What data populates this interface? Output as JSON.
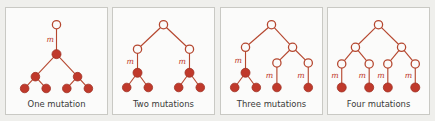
{
  "figure": {
    "background_color": "#efefec",
    "panel_background": "#fbfbfa",
    "panel_border_color": "#c9c9c4",
    "accent_color": "#c0392b",
    "edge_color": "#b5472f",
    "mutation_label": "m"
  },
  "panels": [
    {
      "id": "one-mutation",
      "caption": "One mutation",
      "mutation_count": 1,
      "mutation_labels": [
        "m"
      ],
      "open_nodes": 1,
      "filled_nodes": 7,
      "description": "single mutation on the stem lineage; all descendants filled"
    },
    {
      "id": "two-mutations",
      "caption": "Two mutations",
      "mutation_count": 2,
      "mutation_labels": [
        "m",
        "m"
      ],
      "open_nodes": 3,
      "filled_nodes": 6,
      "description": "two independent mutations, one on each of the two clades"
    },
    {
      "id": "three-mutations",
      "caption": "Three mutations",
      "mutation_count": 3,
      "mutation_labels": [
        "m",
        "m",
        "m"
      ],
      "open_nodes": 5,
      "filled_nodes": 5,
      "description": "three independent mutations on an asymmetric tree"
    },
    {
      "id": "four-mutations",
      "caption": "Four mutations",
      "mutation_count": 4,
      "mutation_labels": [
        "m",
        "m",
        "m",
        "m"
      ],
      "open_nodes": 7,
      "filled_nodes": 4,
      "description": "four independent mutations, one on each terminal branch"
    }
  ]
}
